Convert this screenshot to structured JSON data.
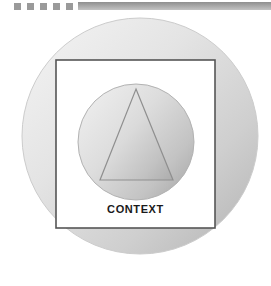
{
  "page": {
    "background_color": "#ffffff",
    "width": 271,
    "height": 286
  },
  "decoration": {
    "name": "top-decorative-band",
    "square_count": 5,
    "square_color": "#9a9a9a",
    "square_size": 7,
    "square_positions_x": [
      14,
      27,
      40,
      53,
      66
    ],
    "bar_color": "#9e9e9e",
    "bar_start_x": 78,
    "bar_end_x": 271
  },
  "diagram": {
    "type": "concentric-shapes",
    "outer_circle": {
      "name": "outer-circle",
      "center_x": 140,
      "center_y": 136,
      "radius": 118,
      "fill_light": "#f2f2f2",
      "fill_dark": "#b5b5b5",
      "stroke": "#c9c9c9"
    },
    "context_square": {
      "name": "context-square",
      "x": 56,
      "y": 60,
      "width": 159,
      "height": 168,
      "fill": "#ffffff",
      "stroke": "#555555",
      "stroke_width": 1.6
    },
    "inner_circle": {
      "name": "inner-circle",
      "center_x": 136,
      "center_y": 142,
      "radius": 58,
      "fill_light": "#ededed",
      "fill_dark": "#a8a8a8",
      "stroke": "#b0b0b0"
    },
    "triangle": {
      "name": "triangle",
      "apex_x": 136,
      "apex_y": 89,
      "base_left_x": 100,
      "base_right_x": 173,
      "base_y": 180,
      "fill_light": "#ececec",
      "fill_dark": "#aeaeae",
      "stroke": "#8f8f8f"
    }
  },
  "labels": {
    "context": "CONTEXT"
  }
}
